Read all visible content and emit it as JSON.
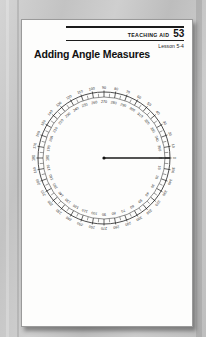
{
  "document": {
    "header": {
      "aid_label": "TEACHING AID",
      "aid_number": "53",
      "lesson": "Lesson 5-4"
    },
    "title": "Adding Angle Measures"
  },
  "chart_data": {
    "type": "scatter",
    "title": "Adding Angle Measures",
    "subtype": "circular-protractor",
    "xlabel": "",
    "ylabel": "",
    "center": {
      "x": 82,
      "y": 72
    },
    "radius_outer": 66,
    "radius_inner": 61,
    "tick_interval_deg": 5,
    "label_interval_deg": 10,
    "scales": [
      {
        "name": "outer-scale",
        "direction": "counterclockwise",
        "zero_at_deg": 0,
        "radius": 70,
        "values": [
          0,
          10,
          20,
          30,
          40,
          50,
          60,
          70,
          80,
          90,
          100,
          110,
          120,
          130,
          140,
          150,
          160,
          170,
          180,
          190,
          200,
          210,
          220,
          230,
          240,
          250,
          260,
          270,
          280,
          290,
          300,
          310,
          320,
          330,
          340,
          350
        ]
      },
      {
        "name": "inner-scale",
        "direction": "clockwise",
        "zero_at_deg": 0,
        "radius": 56,
        "values": [
          0,
          10,
          20,
          30,
          40,
          50,
          60,
          70,
          80,
          90,
          100,
          110,
          120,
          130,
          140,
          150,
          160,
          170,
          180,
          190,
          200,
          210,
          220,
          230,
          240,
          250,
          260,
          270,
          280,
          290,
          300,
          310,
          320,
          330,
          340,
          350
        ]
      }
    ],
    "rays": [
      {
        "name": "base-ray",
        "angle_deg": 0,
        "length": 66,
        "label": ""
      }
    ],
    "annotations": [
      {
        "name": "vertex-point",
        "x": 82,
        "y": 72
      }
    ],
    "grid": false,
    "legend": "none"
  },
  "colors": {
    "page": "#fdfdfc",
    "ink": "#111111",
    "desk": "#c9c9c9",
    "tick": "#1f1f1f"
  }
}
